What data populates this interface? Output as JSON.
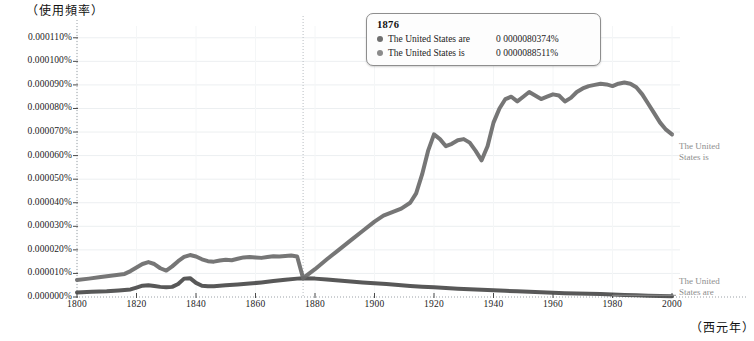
{
  "chart_data": {
    "type": "line",
    "title": "",
    "ylabel": "（使用頻率）",
    "xlabel": "（西元年）",
    "xlim": [
      1800,
      2000
    ],
    "ylim": [
      0.0,
      0.000115
    ],
    "grid": true,
    "legend_position": "right-inline",
    "xticks": [
      "1800",
      "1820",
      "1840",
      "1860",
      "1880",
      "1900",
      "1920",
      "1940",
      "1960",
      "1980",
      "2000"
    ],
    "xtick_values": [
      1800,
      1820,
      1840,
      1860,
      1880,
      1900,
      1920,
      1940,
      1960,
      1980,
      2000
    ],
    "yticks": [
      "0.000110%",
      "0.000100%",
      "0.000090%",
      "0.000080%",
      "0.000070%",
      "0.000060%",
      "0.000050%",
      "0.000040%",
      "0.000030%",
      "0.000020%",
      "0.000010%",
      "0.000000%"
    ],
    "ytick_values": [
      0.00011,
      0.0001,
      9e-05,
      8e-05,
      7e-05,
      6e-05,
      5e-05,
      4e-05,
      3e-05,
      2e-05,
      1e-05,
      0.0
    ],
    "crosshair_year": 1876,
    "series": [
      {
        "name": "The United States are",
        "color": "#4a4a4a",
        "line_width": 4.0,
        "x": [
          1800,
          1805,
          1810,
          1814,
          1818,
          1820,
          1822,
          1824,
          1826,
          1828,
          1830,
          1832,
          1834,
          1836,
          1838,
          1840,
          1842,
          1844,
          1846,
          1848,
          1850,
          1854,
          1858,
          1862,
          1866,
          1870,
          1874,
          1876,
          1880,
          1884,
          1888,
          1892,
          1896,
          1900,
          1904,
          1908,
          1912,
          1916,
          1920,
          1924,
          1928,
          1932,
          1936,
          1940,
          1944,
          1948,
          1952,
          1956,
          1960,
          1964,
          1968,
          1972,
          1976,
          1980,
          1984,
          1988,
          1992,
          1996,
          2000
        ],
        "y": [
          1.9e-06,
          2.2e-06,
          2.4e-06,
          2.8e-06,
          3.2e-06,
          4e-06,
          4.8e-06,
          5e-06,
          4.7e-06,
          4.3e-06,
          4.1e-06,
          4.3e-06,
          5.5e-06,
          7.8e-06,
          8e-06,
          6e-06,
          4.8e-06,
          4.6e-06,
          4.6e-06,
          4.8e-06,
          5e-06,
          5.3e-06,
          5.7e-06,
          6.2e-06,
          6.8e-06,
          7.3e-06,
          7.8e-06,
          8e-06,
          7.8e-06,
          7.4e-06,
          7e-06,
          6.6e-06,
          6.2e-06,
          5.8e-06,
          5.5e-06,
          5.1e-06,
          4.7e-06,
          4.4e-06,
          4.1e-06,
          3.8e-06,
          3.5e-06,
          3.3e-06,
          3.1e-06,
          2.9e-06,
          2.6e-06,
          2.4e-06,
          2.2e-06,
          2e-06,
          1.8e-06,
          1.6e-06,
          1.5e-06,
          1.4e-06,
          1.3e-06,
          1.1e-06,
          9e-07,
          7e-07,
          5e-07,
          4e-07,
          3e-07
        ]
      },
      {
        "name": "The United States is",
        "color": "#6a6a6a",
        "line_width": 4.0,
        "x": [
          1800,
          1804,
          1808,
          1812,
          1816,
          1818,
          1820,
          1822,
          1824,
          1826,
          1828,
          1830,
          1832,
          1834,
          1836,
          1838,
          1840,
          1842,
          1844,
          1846,
          1848,
          1850,
          1852,
          1854,
          1856,
          1858,
          1860,
          1862,
          1864,
          1866,
          1868,
          1870,
          1872,
          1874,
          1876,
          1880,
          1884,
          1888,
          1892,
          1896,
          1900,
          1903,
          1906,
          1909,
          1912,
          1914,
          1916,
          1918,
          1920,
          1922,
          1924,
          1926,
          1928,
          1930,
          1932,
          1934,
          1936,
          1938,
          1940,
          1942,
          1944,
          1946,
          1948,
          1950,
          1952,
          1954,
          1956,
          1958,
          1960,
          1962,
          1964,
          1966,
          1968,
          1970,
          1972,
          1974,
          1976,
          1978,
          1980,
          1982,
          1984,
          1986,
          1988,
          1990,
          1992,
          1994,
          1996,
          1998,
          2000
        ],
        "y": [
          7.2e-06,
          7.8e-06,
          8.5e-06,
          9.1e-06,
          9.8e-06,
          1.1e-05,
          1.25e-05,
          1.4e-05,
          1.48e-05,
          1.4e-05,
          1.22e-05,
          1.12e-05,
          1.3e-05,
          1.52e-05,
          1.7e-05,
          1.78e-05,
          1.72e-05,
          1.6e-05,
          1.52e-05,
          1.5e-05,
          1.55e-05,
          1.58e-05,
          1.56e-05,
          1.62e-05,
          1.68e-05,
          1.7e-05,
          1.68e-05,
          1.66e-05,
          1.7e-05,
          1.73e-05,
          1.72e-05,
          1.74e-05,
          1.76e-05,
          1.72e-05,
          8e-06,
          1.18e-05,
          1.6e-05,
          2e-05,
          2.4e-05,
          2.8e-05,
          3.2e-05,
          3.45e-05,
          3.6e-05,
          3.75e-05,
          4e-05,
          4.4e-05,
          5.2e-05,
          6.2e-05,
          6.9e-05,
          6.7e-05,
          6.4e-05,
          6.5e-05,
          6.65e-05,
          6.7e-05,
          6.55e-05,
          6.2e-05,
          5.8e-05,
          6.4e-05,
          7.4e-05,
          8e-05,
          8.4e-05,
          8.5e-05,
          8.3e-05,
          8.5e-05,
          8.7e-05,
          8.55e-05,
          8.4e-05,
          8.5e-05,
          8.6e-05,
          8.55e-05,
          8.3e-05,
          8.45e-05,
          8.7e-05,
          8.85e-05,
          8.95e-05,
          9e-05,
          9.05e-05,
          9.02e-05,
          8.95e-05,
          9.05e-05,
          9.1e-05,
          9.05e-05,
          8.9e-05,
          8.6e-05,
          8.2e-05,
          7.8e-05,
          7.4e-05,
          7.1e-05,
          6.9e-05
        ]
      }
    ]
  },
  "tooltip": {
    "year": "1876",
    "rows": [
      {
        "dot_color": "#6f6f6f",
        "name": "The United States are",
        "value": "0 0000080374%"
      },
      {
        "dot_color": "#8b8b8b",
        "name": "The United States is",
        "value": "0 0000088511%"
      }
    ]
  },
  "series_tags": {
    "upper": "The United States is",
    "lower": "The United States are"
  },
  "caption": ""
}
